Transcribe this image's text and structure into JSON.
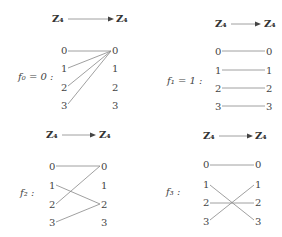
{
  "header_domain": "Z₄",
  "header_codomain": "Z₄",
  "elements": [
    "0",
    "1",
    "2",
    "3"
  ],
  "maps": [
    {
      "label": "f₀ = 0 :",
      "mapping": [
        0,
        0,
        0,
        0
      ]
    },
    {
      "label": "f₁ = 1 :",
      "mapping": [
        0,
        1,
        2,
        3
      ]
    },
    {
      "label": "f₂ :",
      "mapping": [
        0,
        2,
        0,
        2
      ]
    },
    {
      "label": "f₃ :",
      "mapping": [
        0,
        3,
        2,
        1
      ]
    }
  ]
}
